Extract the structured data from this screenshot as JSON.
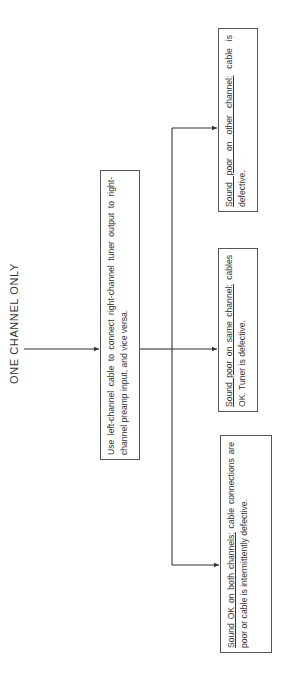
{
  "title": "ONE CHANNEL ONLY",
  "main_step": {
    "text": "Use left-channel cable to connect right-channel tuner output to right-channel preamp input, and vice versa."
  },
  "outcomes": [
    {
      "condition": "Sound poor on other channel:",
      "result": " cable is defective."
    },
    {
      "condition": "Sound poor on same channel:",
      "result": " cables OK. Tuner is defective."
    },
    {
      "condition": "Sound OK on both channels:",
      "result": " cable connections are poor or cable is intermittently defective."
    }
  ],
  "colors": {
    "line": "#333333",
    "box_border": "#555555",
    "text": "#333333",
    "background": "#ffffff"
  }
}
